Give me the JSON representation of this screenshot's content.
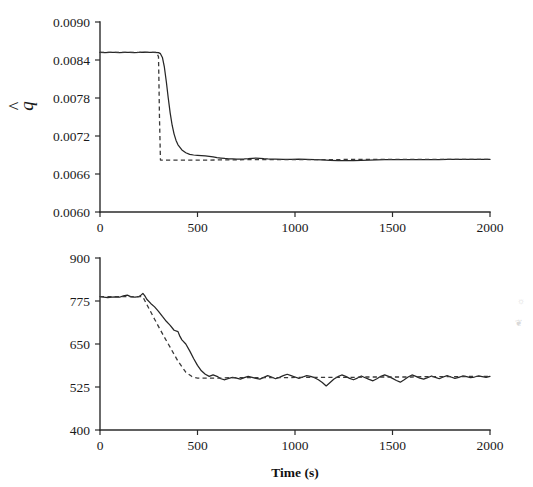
{
  "figure": {
    "background": "#ffffff",
    "ink_color": "#262626",
    "panels": [
      "q-estimate-panel",
      "hmo-estimate-panel"
    ]
  },
  "axis_titles": {
    "x": "Time (s)",
    "y_top_base": "q",
    "y_top_accent": "^",
    "y_bottom_base": "h",
    "y_bottom_subscript": "mo",
    "y_bottom_accent": "⌒"
  },
  "artifacts": {
    "mark_top": "☼",
    "mark_bottom": "❦"
  },
  "chart_data": [
    {
      "id": "q-estimate-panel",
      "type": "line",
      "title": "",
      "xlabel": "Time (s)",
      "ylabel": "q̂",
      "xlim": [
        0,
        2000
      ],
      "ylim": [
        0.006,
        0.009
      ],
      "xticks": [
        0,
        500,
        1000,
        1500,
        2000
      ],
      "yticks": [
        0.006,
        0.0066,
        0.0072,
        0.0078,
        0.0084,
        0.009
      ],
      "xticklabels": [
        "0",
        "500",
        "1000",
        "1500",
        "2000"
      ],
      "yticklabels": [
        "0.0060",
        "0.0066",
        "0.0072",
        "0.0078",
        "0.0084",
        "0.0090"
      ],
      "grid": false,
      "legend": "none",
      "series": [
        {
          "name": "estimated",
          "style": "solid",
          "x": [
            0,
            25,
            50,
            75,
            100,
            125,
            150,
            175,
            200,
            225,
            250,
            275,
            300,
            310,
            320,
            330,
            340,
            350,
            360,
            370,
            380,
            390,
            400,
            420,
            440,
            460,
            480,
            500,
            520,
            540,
            560,
            580,
            600,
            620,
            640,
            660,
            680,
            700,
            720,
            740,
            760,
            780,
            800,
            820,
            840,
            860,
            880,
            900,
            940,
            980,
            1020,
            1060,
            1100,
            1140,
            1180,
            1220,
            1260,
            1300,
            1340,
            1380,
            1420,
            1460,
            1500,
            1540,
            1580,
            1620,
            1660,
            1700,
            1740,
            1780,
            1820,
            1860,
            1900,
            1940,
            1980,
            2000
          ],
          "y": [
            0.00852,
            0.008516,
            0.00852,
            0.008522,
            0.008518,
            0.00852,
            0.008522,
            0.008518,
            0.00852,
            0.008524,
            0.008522,
            0.00852,
            0.008516,
            0.0085,
            0.00844,
            0.00829,
            0.00806,
            0.0078,
            0.00756,
            0.00737,
            0.00723,
            0.00713,
            0.00706,
            0.00698,
            0.006935,
            0.00691,
            0.0069,
            0.006895,
            0.00689,
            0.006885,
            0.006878,
            0.00687,
            0.00686,
            0.006852,
            0.006845,
            0.00684,
            0.006838,
            0.006836,
            0.006836,
            0.006838,
            0.006842,
            0.006848,
            0.006852,
            0.006848,
            0.006842,
            0.006838,
            0.006836,
            0.006834,
            0.006832,
            0.006832,
            0.006834,
            0.006832,
            0.006828,
            0.006822,
            0.006816,
            0.006812,
            0.00681,
            0.006812,
            0.006816,
            0.00682,
            0.006824,
            0.006826,
            0.006828,
            0.006828,
            0.006828,
            0.006826,
            0.006826,
            0.006828,
            0.006828,
            0.00683,
            0.00683,
            0.00683,
            0.00683,
            0.00683,
            0.00683,
            0.00683
          ]
        },
        {
          "name": "reference",
          "style": "dashed",
          "x": [
            0,
            50,
            100,
            150,
            200,
            250,
            290,
            300,
            302,
            305,
            310,
            350,
            400,
            450,
            500,
            560,
            620,
            680,
            740,
            800,
            860,
            920,
            980,
            1040,
            1100,
            1160,
            1220,
            1280,
            1340,
            1400,
            1460,
            1520,
            1580,
            1640,
            1700,
            1760,
            1820,
            1880,
            1940,
            2000
          ],
          "y": [
            0.00852,
            0.00852,
            0.00852,
            0.00852,
            0.00852,
            0.00852,
            0.00852,
            0.00845,
            0.0081,
            0.0075,
            0.00682,
            0.00682,
            0.00682,
            0.00682,
            0.00682,
            0.00682,
            0.006822,
            0.006824,
            0.006826,
            0.006828,
            0.006828,
            0.006828,
            0.006828,
            0.006828,
            0.006828,
            0.006828,
            0.006828,
            0.00683,
            0.00683,
            0.00683,
            0.00683,
            0.00683,
            0.00683,
            0.00683,
            0.00683,
            0.00683,
            0.00683,
            0.00683,
            0.00683,
            0.00683
          ]
        }
      ]
    },
    {
      "id": "hmo-estimate-panel",
      "type": "line",
      "title": "",
      "xlabel": "Time (s)",
      "ylabel": "ĥ_mo",
      "xlim": [
        0,
        2000
      ],
      "ylim": [
        400,
        900
      ],
      "xticks": [
        0,
        500,
        1000,
        1500,
        2000
      ],
      "yticks": [
        400,
        525,
        650,
        775,
        900
      ],
      "xticklabels": [
        "0",
        "500",
        "1000",
        "1500",
        "2000"
      ],
      "yticklabels": [
        "400",
        "525",
        "650",
        "775",
        "900"
      ],
      "grid": false,
      "legend": "none",
      "series": [
        {
          "name": "estimated",
          "style": "solid",
          "x": [
            0,
            20,
            40,
            60,
            80,
            100,
            120,
            140,
            160,
            180,
            200,
            210,
            220,
            230,
            240,
            260,
            280,
            300,
            320,
            340,
            360,
            380,
            400,
            410,
            420,
            440,
            460,
            480,
            500,
            520,
            540,
            560,
            580,
            600,
            620,
            640,
            660,
            680,
            700,
            720,
            740,
            760,
            780,
            800,
            820,
            840,
            860,
            880,
            900,
            920,
            940,
            960,
            980,
            1000,
            1020,
            1040,
            1060,
            1080,
            1100,
            1120,
            1140,
            1160,
            1180,
            1200,
            1220,
            1240,
            1260,
            1280,
            1300,
            1320,
            1340,
            1360,
            1380,
            1400,
            1420,
            1440,
            1460,
            1480,
            1500,
            1520,
            1540,
            1560,
            1580,
            1600,
            1620,
            1640,
            1660,
            1680,
            1700,
            1720,
            1740,
            1760,
            1780,
            1800,
            1820,
            1840,
            1860,
            1880,
            1900,
            1920,
            1940,
            1960,
            1980,
            2000
          ],
          "y": [
            788,
            786,
            785,
            786,
            787,
            786,
            790,
            792,
            787,
            786,
            788,
            792,
            797,
            790,
            780,
            768,
            758,
            745,
            730,
            716,
            704,
            690,
            686,
            672,
            662,
            650,
            630,
            608,
            588,
            572,
            562,
            556,
            560,
            556,
            549,
            546,
            550,
            553,
            551,
            548,
            552,
            556,
            553,
            550,
            548,
            553,
            558,
            554,
            549,
            553,
            558,
            562,
            558,
            554,
            550,
            554,
            558,
            556,
            552,
            546,
            538,
            528,
            538,
            548,
            555,
            560,
            556,
            550,
            546,
            551,
            557,
            552,
            547,
            543,
            549,
            556,
            560,
            556,
            550,
            544,
            539,
            546,
            554,
            560,
            556,
            551,
            548,
            552,
            557,
            553,
            549,
            554,
            558,
            554,
            550,
            553,
            557,
            555,
            552,
            554,
            557,
            555,
            553,
            556
          ]
        },
        {
          "name": "reference",
          "style": "dashed",
          "x": [
            0,
            40,
            80,
            120,
            160,
            200,
            220,
            240,
            280,
            320,
            360,
            400,
            440,
            470,
            490,
            500,
            540,
            580,
            620,
            660,
            700,
            760,
            820,
            880,
            940,
            1000,
            1060,
            1120,
            1180,
            1240,
            1300,
            1360,
            1420,
            1480,
            1540,
            1600,
            1660,
            1720,
            1780,
            1840,
            1900,
            1960,
            2000
          ],
          "y": [
            788,
            788,
            788,
            788,
            788,
            788,
            787,
            765,
            722,
            680,
            640,
            600,
            568,
            556,
            552,
            551,
            551,
            551,
            551,
            552,
            552,
            552,
            552,
            552,
            552,
            553,
            553,
            553,
            553,
            553,
            553,
            554,
            554,
            554,
            554,
            554,
            555,
            555,
            555,
            555,
            556,
            556,
            556
          ]
        }
      ]
    }
  ]
}
